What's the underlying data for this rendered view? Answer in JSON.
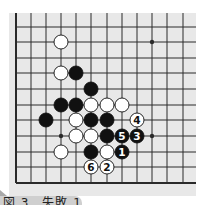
{
  "diagram": {
    "type": "gomoku-board-fragment",
    "colors": {
      "board_bg": "#e8e8e8",
      "line": "#2a2a2a",
      "black_stone": "#111111",
      "white_stone": "#ffffff",
      "caption_bg": "#cfcfcf"
    },
    "grid": {
      "x_lines": [
        16,
        31,
        46,
        61,
        76,
        91,
        107,
        122,
        137,
        152,
        167,
        183
      ],
      "y_lines": [
        27,
        42,
        58,
        73,
        89,
        105,
        120,
        136,
        152,
        167,
        183
      ],
      "board_left": 16,
      "board_bottom": 183,
      "board_top": 13,
      "board_right": 196
    },
    "star_points": [
      {
        "col": 9,
        "row": 1
      },
      {
        "col": 3,
        "row": 7
      },
      {
        "col": 9,
        "row": 7
      }
    ],
    "stones": [
      {
        "color": "white",
        "col": 3,
        "row": 1,
        "label": ""
      },
      {
        "color": "white",
        "col": 3,
        "row": 3,
        "label": ""
      },
      {
        "color": "black",
        "col": 4,
        "row": 3,
        "label": ""
      },
      {
        "color": "black",
        "col": 5,
        "row": 4,
        "label": ""
      },
      {
        "color": "black",
        "col": 3,
        "row": 5,
        "label": ""
      },
      {
        "color": "black",
        "col": 4,
        "row": 5,
        "label": ""
      },
      {
        "color": "white",
        "col": 5,
        "row": 5,
        "label": ""
      },
      {
        "color": "white",
        "col": 6,
        "row": 5,
        "label": ""
      },
      {
        "color": "white",
        "col": 7,
        "row": 5,
        "label": ""
      },
      {
        "color": "black",
        "col": 2,
        "row": 6,
        "label": ""
      },
      {
        "color": "white",
        "col": 4,
        "row": 6,
        "label": ""
      },
      {
        "color": "black",
        "col": 5,
        "row": 6,
        "label": ""
      },
      {
        "color": "black",
        "col": 6,
        "row": 6,
        "label": ""
      },
      {
        "color": "white",
        "col": 8,
        "row": 6,
        "label": "4"
      },
      {
        "color": "white",
        "col": 4,
        "row": 7,
        "label": ""
      },
      {
        "color": "white",
        "col": 5,
        "row": 7,
        "label": ""
      },
      {
        "color": "black",
        "col": 6,
        "row": 7,
        "label": ""
      },
      {
        "color": "black",
        "col": 7,
        "row": 7,
        "label": "5"
      },
      {
        "color": "black",
        "col": 8,
        "row": 7,
        "label": "3"
      },
      {
        "color": "white",
        "col": 3,
        "row": 8,
        "label": ""
      },
      {
        "color": "black",
        "col": 5,
        "row": 8,
        "label": ""
      },
      {
        "color": "white",
        "col": 6,
        "row": 8,
        "label": ""
      },
      {
        "color": "black",
        "col": 7,
        "row": 8,
        "label": "1"
      },
      {
        "color": "white",
        "col": 5,
        "row": 9,
        "label": "6"
      },
      {
        "color": "white",
        "col": 6,
        "row": 9,
        "label": "2"
      }
    ],
    "caption": "図 3　失敗 1"
  }
}
